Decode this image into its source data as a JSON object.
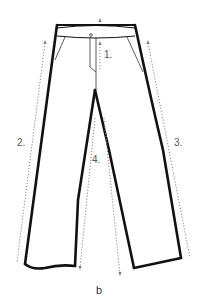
{
  "figure": {
    "caption": "b",
    "colors": {
      "outline": "#111111",
      "dotted": "#888888",
      "label": "#555555",
      "background": "#ffffff"
    },
    "measurements": [
      {
        "id": 1,
        "label": "1.",
        "meaning": "front rise"
      },
      {
        "id": 2,
        "label": "2.",
        "meaning": "outer leg length (left)"
      },
      {
        "id": 3,
        "label": "3.",
        "meaning": "outer leg length (right)"
      },
      {
        "id": 4,
        "label": "4.",
        "meaning": "inseam length"
      }
    ]
  }
}
